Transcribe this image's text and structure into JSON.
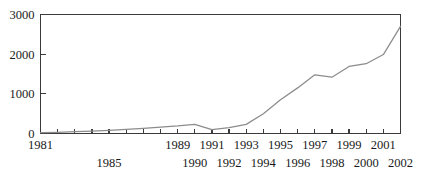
{
  "chart_data": {
    "type": "line",
    "title": "",
    "xlabel": "",
    "ylabel": "",
    "xlim": [
      1981,
      2002
    ],
    "ylim": [
      0,
      3000
    ],
    "grid": false,
    "legend": null,
    "line_color": "#8c8c8c",
    "axis_color": "#3a3a3a",
    "y_ticks": [
      0,
      1000,
      2000,
      3000
    ],
    "y_tick_labels": [
      "0",
      "1000",
      "2000",
      "3000"
    ],
    "x_ticks": [
      1981,
      1982,
      1983,
      1984,
      1985,
      1986,
      1987,
      1988,
      1989,
      1990,
      1991,
      1992,
      1993,
      1994,
      1995,
      1996,
      1997,
      1998,
      1999,
      2000,
      2001,
      2002
    ],
    "x_tick_labels_upper": [
      "1981",
      "",
      "",
      "",
      "",
      "",
      "",
      "",
      "1989",
      "",
      "1991",
      "",
      "1993",
      "",
      "1995",
      "",
      "1997",
      "",
      "1999",
      "",
      "2001",
      ""
    ],
    "x_tick_labels_lower": [
      "",
      "",
      "",
      "",
      "1985",
      "",
      "",
      "",
      "",
      "1990",
      "",
      "1992",
      "",
      "1994",
      "",
      "1996",
      "",
      "1998",
      "",
      "2000",
      "",
      "2002"
    ],
    "x": [
      1981,
      1982,
      1983,
      1984,
      1985,
      1986,
      1987,
      1988,
      1989,
      1990,
      1991,
      1992,
      1993,
      1994,
      1995,
      1996,
      1997,
      1998,
      1999,
      2000,
      2001,
      2002
    ],
    "values": [
      20,
      30,
      45,
      60,
      80,
      105,
      130,
      160,
      190,
      230,
      100,
      150,
      230,
      500,
      850,
      1150,
      1480,
      1420,
      1690,
      1760,
      1990,
      2700
    ]
  }
}
